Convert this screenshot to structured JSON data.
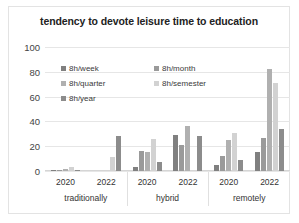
{
  "chart_data": {
    "type": "bar",
    "title": "tendency to devote leisure time to education",
    "xlabel": "",
    "ylabel": "",
    "ylim": [
      0,
      100
    ],
    "yticks": [
      100,
      80,
      60,
      40,
      20,
      0
    ],
    "grid": true,
    "legend_position": "inside-top-left",
    "group_labels": [
      "traditionally",
      "hybrid",
      "remotely"
    ],
    "subgroup_labels": [
      "2020",
      "2022"
    ],
    "categories": [
      "traditionally 2020",
      "traditionally 2022",
      "hybrid 2020",
      "hybrid 2022",
      "remotely 2020",
      "remotely 2022"
    ],
    "series": [
      {
        "name": "8h/week",
        "color": "#808080",
        "values": [
          1,
          0,
          3,
          29,
          5,
          15
        ]
      },
      {
        "name": "8h/month",
        "color": "#9a9a9a",
        "values": [
          1,
          0,
          16,
          21,
          12,
          27
        ]
      },
      {
        "name": "8h/quarter",
        "color": "#b0b0b0",
        "values": [
          2,
          0,
          15,
          36,
          25,
          82
        ]
      },
      {
        "name": "8h/semester",
        "color": "#d2d2d2",
        "values": [
          3,
          11,
          26,
          0,
          31,
          71
        ]
      },
      {
        "name": "8h/year",
        "color": "#8c8c8c",
        "values": [
          1,
          28,
          7,
          28,
          9,
          34
        ]
      }
    ]
  }
}
